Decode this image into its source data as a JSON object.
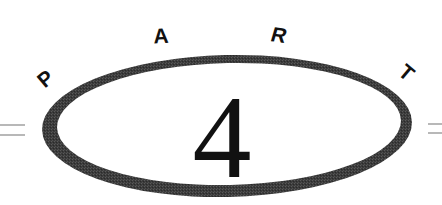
{
  "heading": {
    "word": "PART",
    "letters": [
      "P",
      "A",
      "R",
      "T"
    ],
    "number": "4"
  },
  "colors": {
    "background": "#ffffff",
    "ring": "#3a3a3a",
    "ring_texture": "#555555",
    "text": "#111111",
    "rule": "#9a9a9a"
  }
}
